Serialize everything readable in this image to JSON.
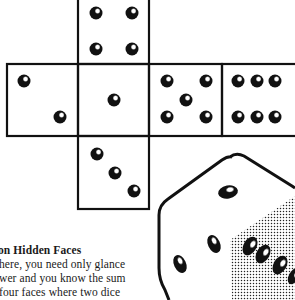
{
  "illustration": {
    "net_faces": [
      {
        "id": "top",
        "pips": 4
      },
      {
        "id": "left",
        "pips": 2
      },
      {
        "id": "center",
        "pips": 1
      },
      {
        "id": "right",
        "pips": 5
      },
      {
        "id": "far-right",
        "pips": 6
      },
      {
        "id": "bottom",
        "pips": 3
      }
    ],
    "die_3d": {
      "top_face_pips": 1,
      "left_face_pips": 3,
      "right_face_pips": 4,
      "right_face_shading": "stippled"
    },
    "colors": {
      "ink": "#111111",
      "paper": "#ffffff"
    }
  },
  "caption": {
    "heading": "on Hidden Faces",
    "lines": [
      "here, you need only glance",
      "wer and you know the sum",
      "four faces where two dice"
    ]
  }
}
